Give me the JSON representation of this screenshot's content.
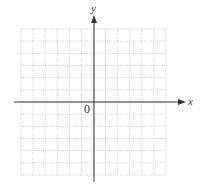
{
  "diagram": {
    "type": "coordinate-plane",
    "x_axis_label": "x",
    "y_axis_label": "y",
    "origin_label": "0",
    "grid": {
      "columns": 12,
      "rows": 12,
      "style": "dotted"
    },
    "colors": {
      "grid": "#b8b8b8",
      "axis": "#333333",
      "label": "#333333"
    }
  }
}
